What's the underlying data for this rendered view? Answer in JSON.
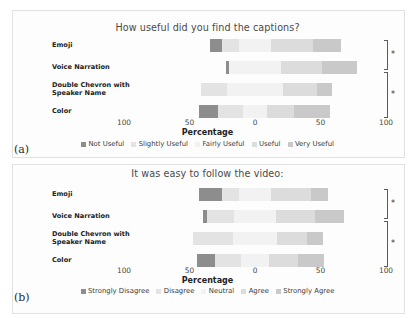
{
  "figure": {
    "panel_a_letter": "(a)",
    "panel_b_letter": "(b)"
  },
  "chart_data": [
    {
      "type": "bar",
      "id": "panel-a",
      "subtype": "diverging-stacked-bar",
      "title": "How useful did you find the captions?",
      "xlabel": "Percentage",
      "ylabel": "",
      "categories": [
        "Emoji",
        "Voice Narration",
        "Double Chevron with\nSpeaker Name",
        "Color"
      ],
      "legend": [
        "Not Useful",
        "Slightly Useful",
        "Fairly Useful",
        "Useful",
        "Very Useful"
      ],
      "legend_position": "bottom",
      "legend_colors": [
        "#8d8d8d",
        "#e3e3e3",
        "#f2f2f2",
        "#dcdcdc",
        "#c9c9c9"
      ],
      "xlim": [
        -100,
        100
      ],
      "xticks": [
        -100,
        -50,
        0,
        50,
        100
      ],
      "xticklabels": [
        "100",
        "50",
        "0",
        "50",
        "100"
      ],
      "grid": false,
      "series": [
        {
          "name": "Not Useful",
          "values": [
            9,
            3,
            0,
            14
          ]
        },
        {
          "name": "Slightly Useful",
          "values": [
            13,
            0,
            20,
            19
          ]
        },
        {
          "name": "Fairly Useful",
          "values": [
            25,
            39,
            43,
            19
          ]
        },
        {
          "name": "Useful",
          "values": [
            32,
            32,
            26,
            20
          ]
        },
        {
          "name": "Very Useful",
          "values": [
            21,
            26,
            11,
            28
          ]
        }
      ],
      "annotations": [
        {
          "type": "significance-bracket",
          "label": "*",
          "from": "Emoji",
          "to": "Voice Narration"
        },
        {
          "type": "significance-bracket",
          "label": "*",
          "from": "Voice Narration",
          "to": "Color"
        }
      ]
    },
    {
      "type": "bar",
      "id": "panel-b",
      "subtype": "diverging-stacked-bar",
      "title": "It was easy to follow the video:",
      "xlabel": "Percentage",
      "ylabel": "",
      "categories": [
        "Emoji",
        "Voice Narration",
        "Double Chevron with\nSpeaker Name",
        "Color"
      ],
      "legend": [
        "Strongly Disagree",
        "Disagree",
        "Neutral",
        "Agree",
        "Strongly Agree"
      ],
      "legend_position": "bottom",
      "legend_colors": [
        "#8d8d8d",
        "#e3e3e3",
        "#f2f2f2",
        "#dcdcdc",
        "#c9c9c9"
      ],
      "xlim": [
        -100,
        100
      ],
      "xticks": [
        -100,
        -50,
        0,
        50,
        100
      ],
      "xticklabels": [
        "100",
        "50",
        "0",
        "50",
        "100"
      ],
      "grid": false,
      "series": [
        {
          "name": "Strongly Disagree",
          "values": [
            17,
            3,
            0,
            14
          ]
        },
        {
          "name": "Disagree",
          "values": [
            13,
            21,
            30,
            20
          ]
        },
        {
          "name": "Neutral",
          "values": [
            25,
            32,
            34,
            21
          ]
        },
        {
          "name": "Agree",
          "values": [
            30,
            30,
            23,
            22
          ]
        },
        {
          "name": "Strongly Agree",
          "values": [
            13,
            22,
            12,
            20
          ]
        }
      ],
      "annotations": [
        {
          "type": "significance-bracket",
          "label": "*",
          "from": "Emoji",
          "to": "Voice Narration"
        },
        {
          "type": "significance-bracket",
          "label": "*",
          "from": "Voice Narration",
          "to": "Color"
        }
      ]
    }
  ]
}
